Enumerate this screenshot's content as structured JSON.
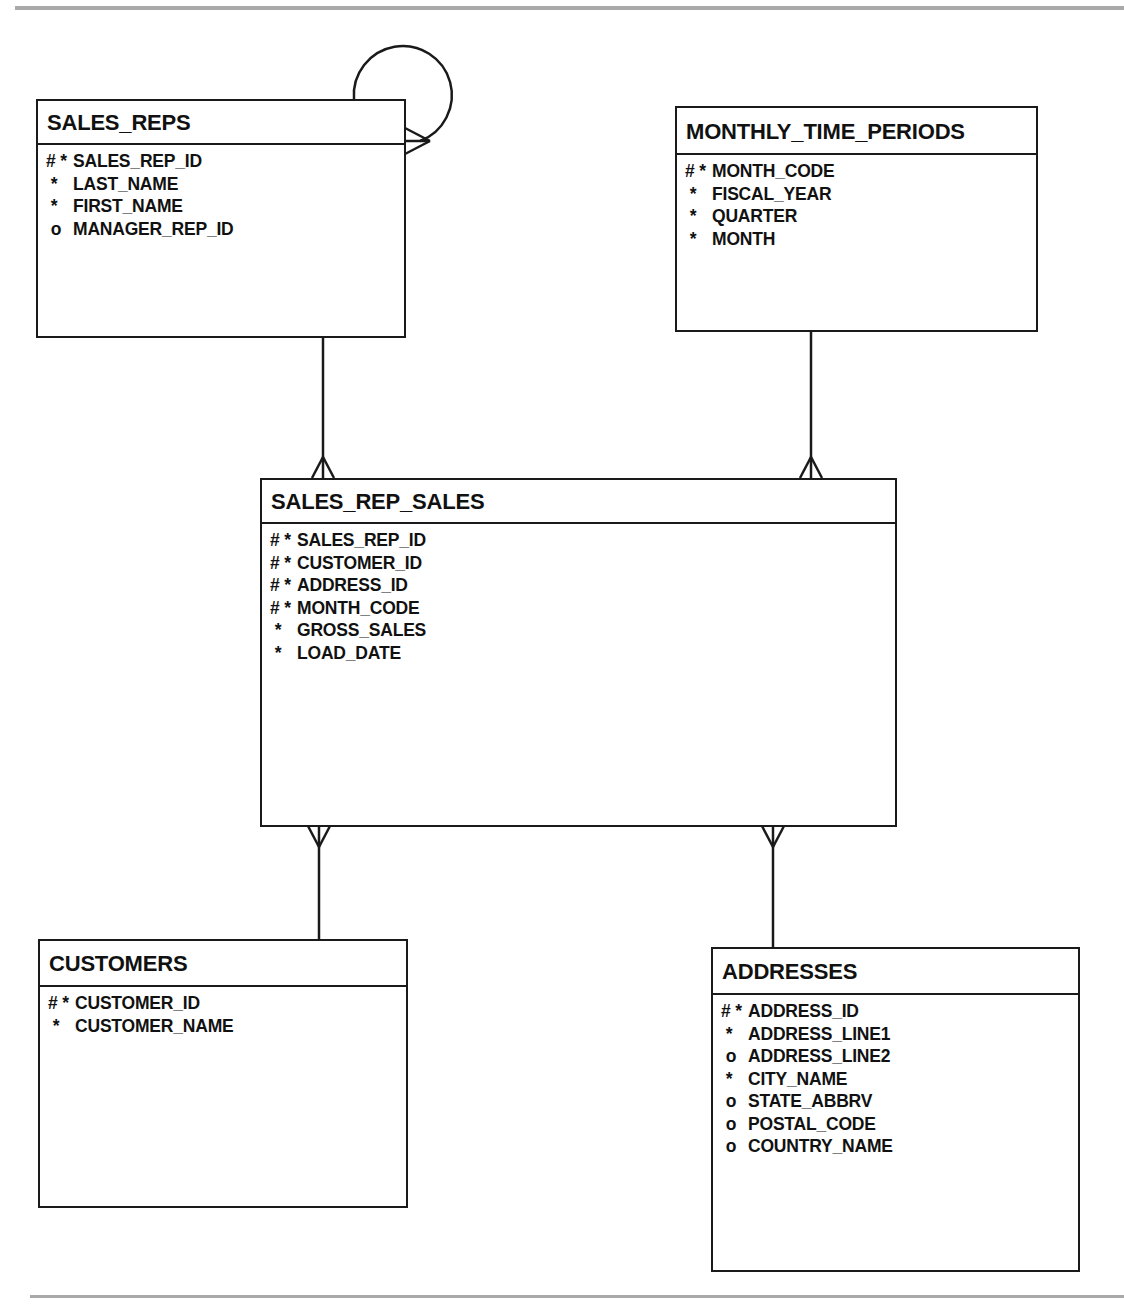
{
  "diagram": {
    "type": "entity-relationship",
    "legend": {
      "#": "primary key (unique identifier)",
      "*": "mandatory attribute",
      "o": "optional attribute"
    },
    "entities": [
      {
        "id": "sales_reps",
        "name": "SALES_REPS",
        "attributes": [
          {
            "marker": "# *",
            "name": "SALES_REP_ID"
          },
          {
            "marker": " *",
            "name": "LAST_NAME"
          },
          {
            "marker": " *",
            "name": "FIRST_NAME"
          },
          {
            "marker": " o",
            "name": "MANAGER_REP_ID"
          }
        ]
      },
      {
        "id": "monthly_time_periods",
        "name": "MONTHLY_TIME_PERIODS",
        "attributes": [
          {
            "marker": "# *",
            "name": "MONTH_CODE"
          },
          {
            "marker": " *",
            "name": "FISCAL_YEAR"
          },
          {
            "marker": " *",
            "name": "QUARTER"
          },
          {
            "marker": " *",
            "name": "MONTH"
          }
        ]
      },
      {
        "id": "sales_rep_sales",
        "name": "SALES_REP_SALES",
        "attributes": [
          {
            "marker": "# *",
            "name": "SALES_REP_ID"
          },
          {
            "marker": "# *",
            "name": "CUSTOMER_ID"
          },
          {
            "marker": "# *",
            "name": "ADDRESS_ID"
          },
          {
            "marker": "# *",
            "name": "MONTH_CODE"
          },
          {
            "marker": " *",
            "name": "GROSS_SALES"
          },
          {
            "marker": " *",
            "name": "LOAD_DATE"
          }
        ]
      },
      {
        "id": "customers",
        "name": "CUSTOMERS",
        "attributes": [
          {
            "marker": "# *",
            "name": "CUSTOMER_ID"
          },
          {
            "marker": " *",
            "name": "CUSTOMER_NAME"
          }
        ]
      },
      {
        "id": "addresses",
        "name": "ADDRESSES",
        "attributes": [
          {
            "marker": "# *",
            "name": "ADDRESS_ID"
          },
          {
            "marker": " *",
            "name": "ADDRESS_LINE1"
          },
          {
            "marker": " o",
            "name": "ADDRESS_LINE2"
          },
          {
            "marker": " *",
            "name": "CITY_NAME"
          },
          {
            "marker": " o",
            "name": "STATE_ABBRV"
          },
          {
            "marker": " o",
            "name": "POSTAL_CODE"
          },
          {
            "marker": " o",
            "name": "COUNTRY_NAME"
          }
        ]
      }
    ],
    "relationships": [
      {
        "from": "SALES_REPS",
        "to": "SALES_REPS",
        "cardinality": "one-to-many (self, manager)"
      },
      {
        "from": "SALES_REPS",
        "to": "SALES_REP_SALES",
        "cardinality": "one-to-many"
      },
      {
        "from": "MONTHLY_TIME_PERIODS",
        "to": "SALES_REP_SALES",
        "cardinality": "one-to-many"
      },
      {
        "from": "CUSTOMERS",
        "to": "SALES_REP_SALES",
        "cardinality": "one-to-many"
      },
      {
        "from": "ADDRESSES",
        "to": "SALES_REP_SALES",
        "cardinality": "one-to-many"
      }
    ],
    "colors": {
      "line": "#1a1a1a",
      "rule": "#a9a9a9",
      "background": "#ffffff"
    }
  }
}
